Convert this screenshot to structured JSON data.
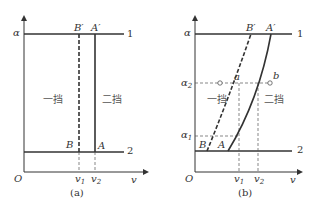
{
  "panel_a": {
    "caption": "(a)",
    "y_axis_label": "α",
    "x_axis_label": "v",
    "origin_label": "O",
    "line_top_label": "1",
    "line_bottom_label": "2",
    "point_B_prime": "B′",
    "point_A_prime": "A′",
    "point_B": "B",
    "point_A": "A",
    "tick_v1": "v",
    "tick_v1_sub": "1",
    "tick_v2": "v",
    "tick_v2_sub": "2",
    "region_first_gear": "一挡",
    "region_second_gear": "二挡"
  },
  "panel_b": {
    "caption": "(b)",
    "y_axis_label": "α",
    "x_axis_label": "v",
    "origin_label": "O",
    "line_top_label": "1",
    "line_bottom_label": "2",
    "point_B_prime": "B′",
    "point_A_prime": "A′",
    "point_B": "B",
    "point_A": "A",
    "point_a": "a",
    "point_b": "b",
    "tick_a1": "α",
    "tick_a1_sub": "1",
    "tick_a2": "α",
    "tick_a2_sub": "2",
    "tick_v1": "v",
    "tick_v1_sub": "1",
    "tick_v2": "v",
    "tick_v2_sub": "2",
    "region_first_gear": "一挡",
    "region_second_gear": "二挡"
  }
}
